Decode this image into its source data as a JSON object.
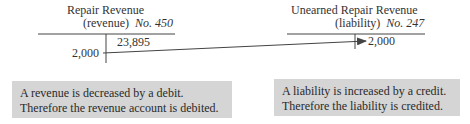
{
  "accounts": [
    {
      "name": "Repair Revenue",
      "type": "(revenue)",
      "number_label": "No. 450",
      "debit_entries": [
        "2,000"
      ],
      "credit_entries": [
        "23,895"
      ]
    },
    {
      "name": "Unearned Repair Revenue",
      "type": "(liability)",
      "number_label": "No. 247",
      "debit_entries": [],
      "credit_entries": [
        "2,000"
      ]
    }
  ],
  "notes": [
    {
      "line1": "A revenue is decreased by a debit.",
      "line2": "Therefore the revenue account is debited."
    },
    {
      "line1": "A liability is increased by a credit.",
      "line2": "Therefore the liability is credited."
    }
  ],
  "colors": {
    "note_background": "#d5d5d5",
    "line": "#444444",
    "text": "#333333"
  }
}
